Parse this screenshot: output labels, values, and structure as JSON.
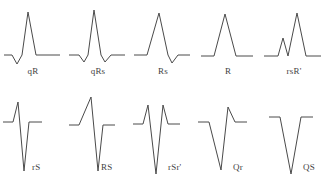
{
  "figure": {
    "stroke_color": "#4a4a4a",
    "label_color": "#3f3f3f",
    "background_color": "#ffffff"
  },
  "waveforms": [
    {
      "label": "qR",
      "row": 0,
      "col": 0,
      "description": "small initial negative q deflection followed by a tall positive R wave",
      "path": "M 4 55 L 12 55 L 17 64 L 22 55 L 28 12 L 36 55 L 60 55"
    },
    {
      "label": "qRs",
      "row": 0,
      "col": 1,
      "description": "small q deflection, tall R wave, then a small terminal s deflection",
      "path": "M 4 55 L 14 55 L 19 62 L 23 55 L 29 10 L 36 55 L 40 62 L 46 55 L 60 55"
    },
    {
      "label": "Rs",
      "row": 0,
      "col": 2,
      "description": "tall positive R wave followed by a small negative s deflection",
      "path": "M 4 55 L 17 55 L 29 13 L 38 55 L 42 63 L 48 55 L 60 55"
    },
    {
      "label": "R",
      "row": 0,
      "col": 3,
      "description": "single entirely positive R wave with no negative deflections",
      "path": "M 6 56 L 19 56 L 30 14 L 41 56 L 58 56"
    },
    {
      "label": "rsR'",
      "row": 0,
      "col": 4,
      "description": "small r wave, small s deflection, then a tall second positive R prime wave",
      "path": "M 3 56 L 17 56 L 22 38 L 27 56 L 36 13 L 45 56 L 60 56"
    },
    {
      "label": "rS",
      "row": 1,
      "col": 0,
      "description": "small initial r wave followed by a deep negative S wave",
      "path": "M 3 30 L 13 30 L 18 10 L 24 79 L 29 30 L 42 30"
    },
    {
      "label": "RS",
      "row": 1,
      "col": 1,
      "description": "tall R wave followed by a deep negative S wave of similar magnitude",
      "path": "M 4 33 L 14 33 L 26 5 L 33 79 L 38 33 L 50 33"
    },
    {
      "label": "rSr'",
      "row": 1,
      "col": 2,
      "description": "small r wave, very deep S wave, then a small terminal r prime wave",
      "path": "M 3 32 L 13 32 L 18 13 L 26 82 L 33 13 L 38 32 L 50 32"
    },
    {
      "label": "Qr",
      "row": 1,
      "col": 3,
      "description": "deep initial negative Q wave followed by a small positive r wave",
      "path": "M 3 30 L 14 30 L 26 78 L 33 15 L 40 30 L 52 30"
    },
    {
      "label": "QS",
      "row": 1,
      "col": 4,
      "description": "single entirely negative QS deflection with no positive component",
      "path": "M 8 25 L 19 25 L 30 82 L 40 25 L 52 25"
    }
  ]
}
